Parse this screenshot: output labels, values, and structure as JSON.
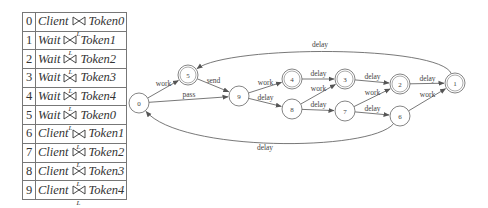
{
  "table": {
    "join_symbol": "bowtie-join",
    "join_subscript": "L",
    "rows": [
      {
        "index": "0",
        "left": "Client",
        "right": "Token0"
      },
      {
        "index": "1",
        "left": "Wait",
        "right": "Token1"
      },
      {
        "index": "2",
        "left": "Wait",
        "right": "Token2"
      },
      {
        "index": "3",
        "left": "Wait",
        "right": "Token3"
      },
      {
        "index": "4",
        "left": "Wait",
        "right": "Token4"
      },
      {
        "index": "5",
        "left": "Wait",
        "right": "Token0"
      },
      {
        "index": "6",
        "left": "Client",
        "right": "Token1"
      },
      {
        "index": "7",
        "left": "Client",
        "right": "Token2"
      },
      {
        "index": "8",
        "left": "Client",
        "right": "Token3"
      },
      {
        "index": "9",
        "left": "Client",
        "right": "Token4"
      }
    ]
  },
  "graph": {
    "nodes": [
      {
        "id": "0",
        "x": 139,
        "y": 103,
        "double": false
      },
      {
        "id": "5",
        "x": 188,
        "y": 75,
        "double": true
      },
      {
        "id": "9",
        "x": 239,
        "y": 96,
        "double": false
      },
      {
        "id": "4",
        "x": 292,
        "y": 79,
        "double": true
      },
      {
        "id": "8",
        "x": 292,
        "y": 109,
        "double": false
      },
      {
        "id": "3",
        "x": 345,
        "y": 79,
        "double": true
      },
      {
        "id": "7",
        "x": 345,
        "y": 111,
        "double": false
      },
      {
        "id": "2",
        "x": 400,
        "y": 84,
        "double": true
      },
      {
        "id": "6",
        "x": 400,
        "y": 116,
        "double": false
      },
      {
        "id": "1",
        "x": 455,
        "y": 83,
        "double": true
      }
    ],
    "edges": [
      {
        "from": "0",
        "to": "5",
        "label": "work"
      },
      {
        "from": "0",
        "to": "9",
        "label": "pass"
      },
      {
        "from": "5",
        "to": "9",
        "label": "send"
      },
      {
        "from": "9",
        "to": "4",
        "label": "work"
      },
      {
        "from": "9",
        "to": "8",
        "label": "delay"
      },
      {
        "from": "4",
        "to": "3",
        "label": "delay"
      },
      {
        "from": "8",
        "to": "3",
        "label": "work"
      },
      {
        "from": "8",
        "to": "7",
        "label": "delay"
      },
      {
        "from": "3",
        "to": "2",
        "label": "delay"
      },
      {
        "from": "7",
        "to": "2",
        "label": "work"
      },
      {
        "from": "7",
        "to": "6",
        "label": "delay"
      },
      {
        "from": "2",
        "to": "1",
        "label": "delay"
      },
      {
        "from": "6",
        "to": "1",
        "label": "work"
      },
      {
        "from": "1",
        "to": "5",
        "label": "delay"
      },
      {
        "from": "6",
        "to": "0",
        "label": "delay"
      }
    ]
  }
}
